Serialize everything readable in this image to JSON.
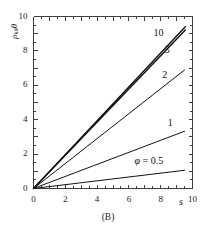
{
  "chart_data": {
    "type": "line",
    "title": "",
    "caption": "(B)",
    "xlabel": "s",
    "ylabel": "p_kθ θ",
    "ylabel_base": "ρ",
    "ylabel_sub": "kθ",
    "ylabel_tail": "θ",
    "xlim": [
      0,
      10
    ],
    "ylim": [
      0,
      10
    ],
    "grid": false,
    "legend_position": "inline-curve-labels",
    "x_major_ticks": [
      0,
      1,
      2,
      3,
      4,
      5,
      6,
      7,
      8,
      9,
      10
    ],
    "y_major_ticks": [
      0,
      1,
      2,
      3,
      4,
      5,
      6,
      7,
      8,
      9,
      10
    ],
    "x_tick_labels": [
      {
        "value": 0,
        "text": "0"
      },
      {
        "value": 2,
        "text": "2"
      },
      {
        "value": 4,
        "text": "4"
      },
      {
        "value": 6,
        "text": "6"
      },
      {
        "value": 8,
        "text": "8"
      },
      {
        "value": 10,
        "text": "10"
      }
    ],
    "y_tick_labels": [
      {
        "value": 0,
        "text": "0"
      },
      {
        "value": 2,
        "text": "2"
      },
      {
        "value": 4,
        "text": "4"
      },
      {
        "value": 6,
        "text": "6"
      },
      {
        "value": 8,
        "text": "8"
      },
      {
        "value": 10,
        "text": "10"
      }
    ],
    "minor_tick_step": 0.5,
    "axis_color": "#3f3f3f",
    "curve_color": "#111111",
    "series": [
      {
        "name": "10",
        "label": "10",
        "phi": 10,
        "slope": 0.985,
        "x": [
          0,
          9.55
        ],
        "values": [
          0,
          9.41
        ],
        "linewidth": 1.4,
        "label_x": 7.55,
        "label_y": 9.05
      },
      {
        "name": "5",
        "label": "5",
        "phi": 5,
        "slope": 0.965,
        "x": [
          0,
          9.55
        ],
        "values": [
          0,
          9.22
        ],
        "linewidth": 1.4,
        "label_x": 8.25,
        "label_y": 8.05
      },
      {
        "name": "2",
        "label": "2",
        "phi": 2,
        "slope": 0.725,
        "x": [
          0,
          9.5
        ],
        "values": [
          0,
          6.89
        ],
        "linewidth": 1.0,
        "label_x": 8.1,
        "label_y": 6.6
      },
      {
        "name": "1",
        "label": "1",
        "phi": 1,
        "slope": 0.35,
        "x": [
          0,
          9.5
        ],
        "values": [
          0,
          3.33
        ],
        "linewidth": 1.0,
        "label_x": 8.45,
        "label_y": 3.8
      },
      {
        "name": "0.5",
        "label": "φ = 0.5",
        "phi": 0.5,
        "slope": 0.112,
        "x": [
          0,
          9.5
        ],
        "values": [
          0,
          1.06
        ],
        "linewidth": 1.0,
        "label_x": 6.35,
        "label_y": 1.62
      }
    ]
  },
  "figure": {
    "caption": "(B)",
    "x_axis_title": "s"
  }
}
